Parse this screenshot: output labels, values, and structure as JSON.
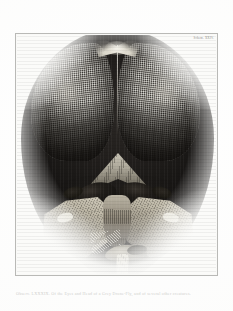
{
  "page": {
    "background_color": "#fdfdfc",
    "plate_border_color": "#b9b9b6"
  },
  "plate": {
    "number_label": "Schem. XXIV.",
    "subject": "Head and eyes of a drone-fly",
    "frame": {
      "x": 15,
      "y": 33,
      "width": 203,
      "height": 243
    }
  },
  "figure": {
    "title": "Of the Eyes and Head of a Grey Drone-Fly",
    "parts": [
      {
        "name": "compound-eye-left",
        "label": "Left compound eye"
      },
      {
        "name": "compound-eye-right",
        "label": "Right compound eye"
      },
      {
        "name": "vertex-crest",
        "label": "Vertex"
      },
      {
        "name": "frons",
        "label": "Frons"
      },
      {
        "name": "antenna-left",
        "label": "Left antenna"
      },
      {
        "name": "antenna-right",
        "label": "Right antenna"
      },
      {
        "name": "gena-left",
        "label": "Left cheek"
      },
      {
        "name": "gena-right",
        "label": "Right cheek"
      },
      {
        "name": "clypeus",
        "label": "Clypeus"
      },
      {
        "name": "proboscis",
        "label": "Proboscis"
      }
    ],
    "ink_colors": {
      "darkest": "#141211",
      "mid": "#514e49",
      "light": "#cfcabb",
      "paper": "#fbfbf9"
    }
  },
  "caption": {
    "text": "Observ. LXXXIX. Of the Eyes and Head of a Grey Drone-Fly, and of several other creatures."
  }
}
